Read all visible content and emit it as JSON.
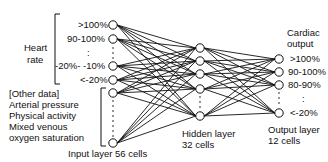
{
  "diagram": {
    "input_group": {
      "heart_rate_label_line1": "Heart",
      "heart_rate_label_line2": "rate",
      "heart_rate_bins": [
        ">100%",
        "90-100%",
        ":",
        "-20%- -10%",
        "<-20%"
      ],
      "other_data_lines": [
        "[Other data]",
        "Arterial pressure",
        "Physical activity",
        "Mixed venous",
        "oxygen saturation"
      ],
      "caption": "Input layer  56 cells"
    },
    "hidden_group": {
      "caption_line1": "Hidden layer",
      "caption_line2": "32 cells"
    },
    "output_group": {
      "title_line1": "Cardiac",
      "title_line2": "output",
      "bins": [
        ">100%",
        "90-100%",
        "80-90%",
        ":",
        "<-20%"
      ],
      "caption_line1": "Output layer",
      "caption_line2": "12 cells"
    },
    "nodes": {
      "input": [
        [
          113,
          25
        ],
        [
          113,
          39
        ],
        [
          113,
          66
        ],
        [
          113,
          80
        ],
        [
          113,
          93
        ],
        [
          113,
          143
        ]
      ],
      "hidden": [
        [
          200,
          48
        ],
        [
          200,
          61
        ],
        [
          200,
          74
        ],
        [
          200,
          89
        ],
        [
          200,
          116
        ]
      ],
      "output": [
        [
          279,
          59
        ],
        [
          279,
          72
        ],
        [
          279,
          85
        ],
        [
          279,
          113
        ]
      ]
    }
  }
}
